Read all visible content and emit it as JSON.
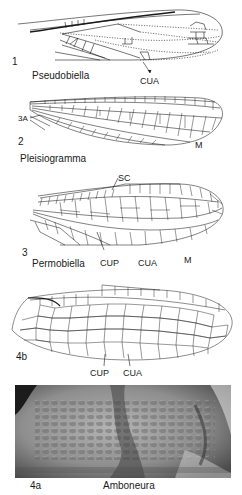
{
  "figure": {
    "panels": [
      {
        "number": "1",
        "genus": "Pseudobiella",
        "vein_labels": [
          "CUA"
        ]
      },
      {
        "number": "2",
        "genus": "Pleisiogramma",
        "vein_labels": [
          "3A",
          "M"
        ]
      },
      {
        "number": "3",
        "genus": "Permobiella",
        "vein_labels": [
          "SC",
          "CUP",
          "CUA",
          "M"
        ]
      },
      {
        "number": "4b",
        "genus": "",
        "vein_labels": [
          "CUP",
          "CUA"
        ]
      },
      {
        "number": "4a",
        "genus": "Amboneura",
        "vein_labels": [],
        "type": "photograph"
      }
    ],
    "colors": {
      "line": "#1a1a1a",
      "background": "#ffffff",
      "photo_mid": "#8a8a8a",
      "photo_dark": "#2a2a2a"
    }
  }
}
